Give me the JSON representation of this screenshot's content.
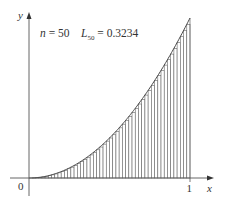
{
  "figure": {
    "type": "left-riemann-sum",
    "function": "y = x^2",
    "n": 50,
    "annotation": {
      "n_label": "n",
      "n_eq": " = 50",
      "L_label": "L",
      "L_sub": "50",
      "L_eq": " = 0.3234"
    },
    "axes": {
      "x_label": "x",
      "y_label": "y",
      "origin_label": "0",
      "x_tick_label": "1"
    },
    "colors": {
      "bar_stroke": "#666666",
      "bar_fill": "#ffffff",
      "axis": "#555555",
      "curve": "#444444"
    }
  },
  "chart_data": {
    "type": "bar",
    "title": "n = 50  L50 = 0.3234",
    "xlabel": "x",
    "ylabel": "y",
    "xlim": [
      0,
      1
    ],
    "ylim": [
      0,
      1
    ],
    "function": "x^2",
    "n": 50,
    "sum_label": "L50",
    "sum_value": 0.3234,
    "x_ticks": [
      "0",
      "1"
    ],
    "grid": false
  }
}
